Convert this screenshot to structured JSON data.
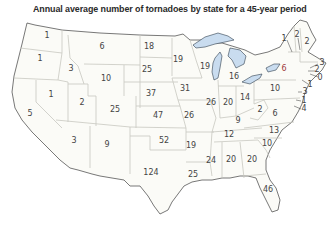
{
  "title": "Annual average number of tornadoes by state for a 45-year period",
  "colors": {
    "land": "#fbfbf7",
    "border": "#c8c8c0",
    "coast": "#555555",
    "lakes": "#c9dcef",
    "text": "#444444",
    "ny_text": "#a04040"
  },
  "states": [
    {
      "state": "WA",
      "value": "1",
      "x": 47,
      "y": 36
    },
    {
      "state": "OR",
      "value": "1",
      "x": 40,
      "y": 59
    },
    {
      "state": "CA",
      "value": "5",
      "x": 30,
      "y": 114
    },
    {
      "state": "NV",
      "value": "1",
      "x": 51,
      "y": 95
    },
    {
      "state": "ID",
      "value": "3",
      "x": 71,
      "y": 69
    },
    {
      "state": "MT",
      "value": "6",
      "x": 102,
      "y": 47
    },
    {
      "state": "WY",
      "value": "10",
      "x": 106,
      "y": 79
    },
    {
      "state": "UT",
      "value": "2",
      "x": 82,
      "y": 103
    },
    {
      "state": "AZ",
      "value": "3",
      "x": 74,
      "y": 141
    },
    {
      "state": "CO",
      "value": "25",
      "x": 115,
      "y": 110
    },
    {
      "state": "NM",
      "value": "9",
      "x": 107,
      "y": 145
    },
    {
      "state": "ND",
      "value": "18",
      "x": 149,
      "y": 47
    },
    {
      "state": "SD",
      "value": "25",
      "x": 147,
      "y": 70
    },
    {
      "state": "NE",
      "value": "37",
      "x": 151,
      "y": 94
    },
    {
      "state": "KS",
      "value": "47",
      "x": 158,
      "y": 116
    },
    {
      "state": "OK",
      "value": "52",
      "x": 164,
      "y": 141
    },
    {
      "state": "TX",
      "value": "124",
      "x": 151,
      "y": 173
    },
    {
      "state": "MN",
      "value": "19",
      "x": 178,
      "y": 60
    },
    {
      "state": "IA",
      "value": "31",
      "x": 185,
      "y": 89
    },
    {
      "state": "MO",
      "value": "26",
      "x": 189,
      "y": 116
    },
    {
      "state": "AR",
      "value": "19",
      "x": 191,
      "y": 146
    },
    {
      "state": "LA",
      "value": "25",
      "x": 193,
      "y": 175
    },
    {
      "state": "WI",
      "value": "19",
      "x": 205,
      "y": 67
    },
    {
      "state": "IL",
      "value": "26",
      "x": 211,
      "y": 103
    },
    {
      "state": "MI",
      "value": "16",
      "x": 234,
      "y": 77
    },
    {
      "state": "IN",
      "value": "20",
      "x": 228,
      "y": 103
    },
    {
      "state": "OH",
      "value": "14",
      "x": 245,
      "y": 98
    },
    {
      "state": "KY",
      "value": "9",
      "x": 238,
      "y": 121
    },
    {
      "state": "TN",
      "value": "12",
      "x": 229,
      "y": 135
    },
    {
      "state": "MS",
      "value": "24",
      "x": 211,
      "y": 161
    },
    {
      "state": "AL",
      "value": "20",
      "x": 231,
      "y": 160
    },
    {
      "state": "GA",
      "value": "20",
      "x": 252,
      "y": 160
    },
    {
      "state": "FL",
      "value": "46",
      "x": 268,
      "y": 190
    },
    {
      "state": "SC",
      "value": "10",
      "x": 267,
      "y": 144
    },
    {
      "state": "NC",
      "value": "13",
      "x": 274,
      "y": 131
    },
    {
      "state": "VA",
      "value": "6",
      "x": 275,
      "y": 114
    },
    {
      "state": "WV",
      "value": "2",
      "x": 260,
      "y": 110
    },
    {
      "state": "PA",
      "value": "10",
      "x": 275,
      "y": 89
    },
    {
      "state": "NY",
      "value": "6",
      "x": 284,
      "y": 69
    },
    {
      "state": "VT",
      "value": "1",
      "x": 284,
      "y": 39
    },
    {
      "state": "NH",
      "value": "2",
      "x": 297,
      "y": 35
    },
    {
      "state": "ME",
      "value": "2",
      "x": 307,
      "y": 42
    },
    {
      "state": "MA",
      "value": "3",
      "x": 322,
      "y": 63
    },
    {
      "state": "RI",
      "value": "2",
      "x": 317,
      "y": 70
    },
    {
      "state": "CT",
      "value": "0",
      "x": 320,
      "y": 78
    },
    {
      "state": "NJ",
      "value": "1",
      "x": 310,
      "y": 85
    },
    {
      "state": "DE",
      "value": "3",
      "x": 305,
      "y": 92
    },
    {
      "state": "MD",
      "value": "1",
      "x": 304,
      "y": 101
    },
    {
      "state": "DC_MD",
      "value": "4",
      "x": 304,
      "y": 109
    }
  ]
}
